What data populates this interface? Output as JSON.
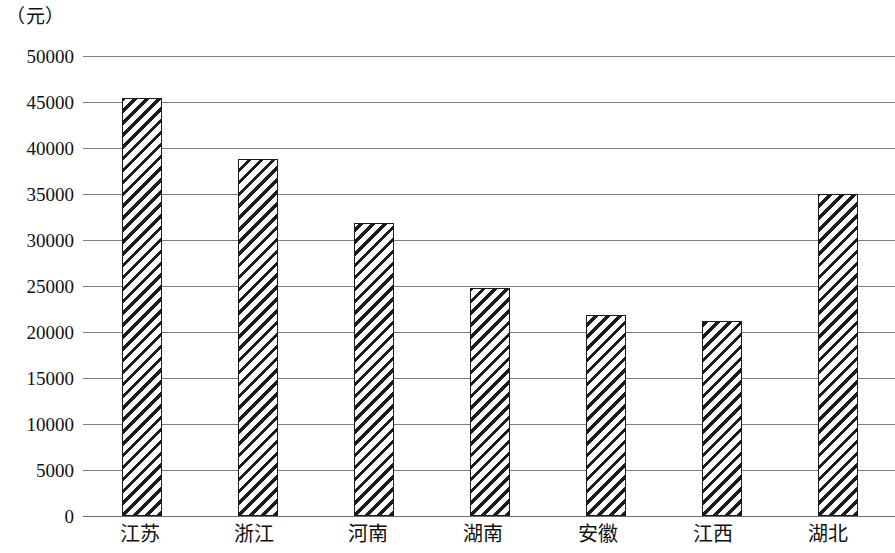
{
  "chart_data": {
    "type": "bar",
    "title": "",
    "subtitle": "",
    "unit_label": "（元）",
    "xlabel": "",
    "ylabel": "",
    "categories": [
      "江苏",
      "浙江",
      "河南",
      "湖南",
      "安徽",
      "江西",
      "湖北"
    ],
    "values": [
      45400,
      38800,
      31900,
      24800,
      21800,
      21200,
      35000
    ],
    "series": [
      {
        "name": "",
        "values": [
          45400,
          38800,
          31900,
          24800,
          21800,
          21200,
          35000
        ]
      }
    ],
    "ylim": [
      0,
      50000
    ],
    "ytick_labels": [
      "50000",
      "45000",
      "40000",
      "35000",
      "30000",
      "25000",
      "20000",
      "15000",
      "10000",
      "5000",
      "0"
    ],
    "ytick_values": [
      50000,
      45000,
      40000,
      35000,
      30000,
      25000,
      20000,
      15000,
      10000,
      5000,
      0
    ],
    "ytick_step": 5000,
    "grid": true,
    "grid_axis": "y",
    "legend": false,
    "legend_position": "none",
    "bar_fill": "hatch-diagonal",
    "bar_color": "#1b1b1b",
    "grid_color": "#7d7d7d",
    "background": "#ffffff",
    "annotations": []
  }
}
